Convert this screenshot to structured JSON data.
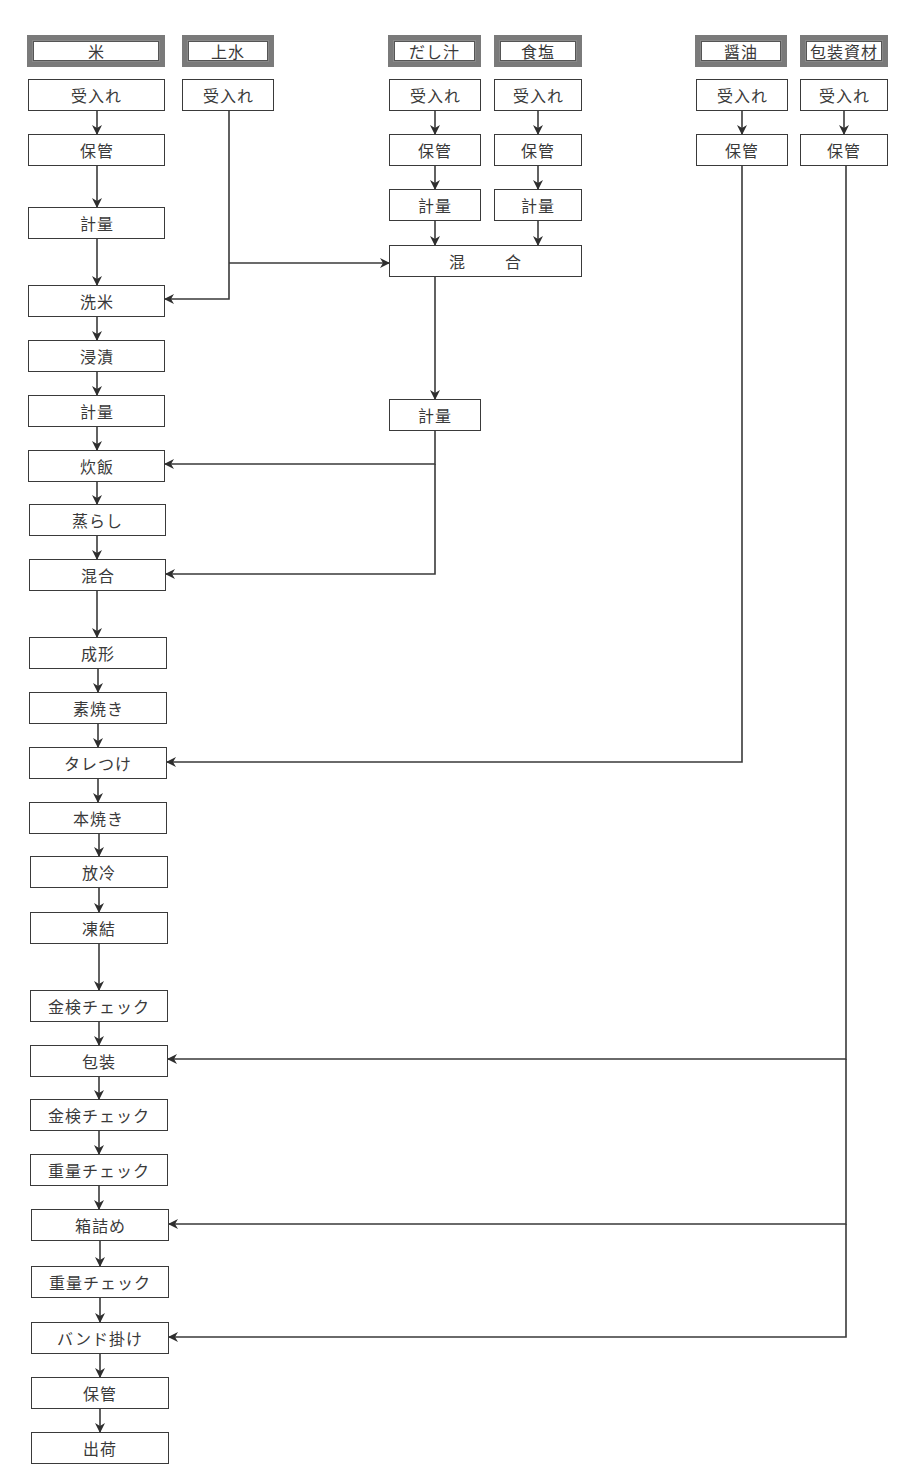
{
  "title": "",
  "colors": {
    "line": "#3a3a3a",
    "source_border": "#7a7a7a",
    "background": "#ffffff"
  },
  "sources": [
    {
      "id": "rice",
      "label": "米",
      "x": 27,
      "y": 35,
      "w": 138,
      "h": 32
    },
    {
      "id": "water",
      "label": "上水",
      "x": 182,
      "y": 35,
      "w": 92,
      "h": 32
    },
    {
      "id": "dashi",
      "label": "だし汁",
      "x": 388,
      "y": 35,
      "w": 93,
      "h": 32
    },
    {
      "id": "salt",
      "label": "食塩",
      "x": 494,
      "y": 35,
      "w": 88,
      "h": 32
    },
    {
      "id": "soy",
      "label": "醤油",
      "x": 695,
      "y": 35,
      "w": 92,
      "h": 32
    },
    {
      "id": "packaging",
      "label": "包装資材",
      "x": 800,
      "y": 35,
      "w": 88,
      "h": 32
    }
  ],
  "steps": [
    {
      "id": "rice-receive",
      "label": "受入れ",
      "x": 28,
      "y": 79,
      "w": 137,
      "h": 32
    },
    {
      "id": "water-receive",
      "label": "受入れ",
      "x": 182,
      "y": 79,
      "w": 92,
      "h": 32
    },
    {
      "id": "dashi-receive",
      "label": "受入れ",
      "x": 389,
      "y": 79,
      "w": 92,
      "h": 32
    },
    {
      "id": "salt-receive",
      "label": "受入れ",
      "x": 494,
      "y": 79,
      "w": 88,
      "h": 32
    },
    {
      "id": "soy-receive",
      "label": "受入れ",
      "x": 696,
      "y": 79,
      "w": 92,
      "h": 32
    },
    {
      "id": "pack-receive",
      "label": "受入れ",
      "x": 800,
      "y": 79,
      "w": 88,
      "h": 32
    },
    {
      "id": "rice-store",
      "label": "保管",
      "x": 28,
      "y": 134,
      "w": 137,
      "h": 32
    },
    {
      "id": "dashi-store",
      "label": "保管",
      "x": 389,
      "y": 134,
      "w": 92,
      "h": 32
    },
    {
      "id": "salt-store",
      "label": "保管",
      "x": 494,
      "y": 134,
      "w": 88,
      "h": 32
    },
    {
      "id": "soy-store",
      "label": "保管",
      "x": 696,
      "y": 134,
      "w": 92,
      "h": 32
    },
    {
      "id": "pack-store",
      "label": "保管",
      "x": 800,
      "y": 134,
      "w": 88,
      "h": 32
    },
    {
      "id": "rice-weigh",
      "label": "計量",
      "x": 28,
      "y": 207,
      "w": 137,
      "h": 32
    },
    {
      "id": "dashi-weigh",
      "label": "計量",
      "x": 389,
      "y": 189,
      "w": 92,
      "h": 32
    },
    {
      "id": "salt-weigh",
      "label": "計量",
      "x": 494,
      "y": 189,
      "w": 88,
      "h": 32
    },
    {
      "id": "seasoning-mix",
      "label_left": "混",
      "label_right": "合",
      "x": 389,
      "y": 245,
      "w": 193,
      "h": 32
    },
    {
      "id": "wash",
      "label": "洗米",
      "x": 28,
      "y": 285,
      "w": 137,
      "h": 32
    },
    {
      "id": "soak",
      "label": "浸漬",
      "x": 28,
      "y": 340,
      "w": 137,
      "h": 32
    },
    {
      "id": "weigh2",
      "label": "計量",
      "x": 28,
      "y": 395,
      "w": 137,
      "h": 32
    },
    {
      "id": "seasoning-weigh",
      "label": "計量",
      "x": 389,
      "y": 399,
      "w": 92,
      "h": 32
    },
    {
      "id": "cook",
      "label": "炊飯",
      "x": 28,
      "y": 450,
      "w": 137,
      "h": 32
    },
    {
      "id": "steam",
      "label": "蒸らし",
      "x": 29,
      "y": 504,
      "w": 137,
      "h": 32
    },
    {
      "id": "mix",
      "label": "混合",
      "x": 29,
      "y": 559,
      "w": 137,
      "h": 32
    },
    {
      "id": "form",
      "label": "成形",
      "x": 29,
      "y": 637,
      "w": 138,
      "h": 32
    },
    {
      "id": "prebake",
      "label": "素焼き",
      "x": 29,
      "y": 692,
      "w": 138,
      "h": 32
    },
    {
      "id": "sauce",
      "label": "タレつけ",
      "x": 29,
      "y": 747,
      "w": 138,
      "h": 32
    },
    {
      "id": "bake",
      "label": "本焼き",
      "x": 29,
      "y": 802,
      "w": 138,
      "h": 32
    },
    {
      "id": "cool",
      "label": "放冷",
      "x": 30,
      "y": 856,
      "w": 138,
      "h": 32
    },
    {
      "id": "freeze",
      "label": "凍結",
      "x": 30,
      "y": 912,
      "w": 138,
      "h": 32
    },
    {
      "id": "metal-check1",
      "label": "金検チェック",
      "x": 30,
      "y": 990,
      "w": 138,
      "h": 32
    },
    {
      "id": "pack",
      "label": "包装",
      "x": 30,
      "y": 1045,
      "w": 138,
      "h": 32
    },
    {
      "id": "metal-check2",
      "label": "金検チェック",
      "x": 30,
      "y": 1099,
      "w": 138,
      "h": 32
    },
    {
      "id": "weight-check1",
      "label": "重量チェック",
      "x": 30,
      "y": 1154,
      "w": 138,
      "h": 32
    },
    {
      "id": "boxing",
      "label": "箱詰め",
      "x": 31,
      "y": 1209,
      "w": 138,
      "h": 32
    },
    {
      "id": "weight-check2",
      "label": "重量チェック",
      "x": 31,
      "y": 1266,
      "w": 138,
      "h": 32
    },
    {
      "id": "banding",
      "label": "バンド掛け",
      "x": 31,
      "y": 1322,
      "w": 138,
      "h": 32
    },
    {
      "id": "final-store",
      "label": "保管",
      "x": 31,
      "y": 1377,
      "w": 138,
      "h": 32
    },
    {
      "id": "ship",
      "label": "出荷",
      "x": 31,
      "y": 1432,
      "w": 138,
      "h": 32
    }
  ],
  "arrows": [
    [
      [
        97,
        111
      ],
      [
        97,
        134
      ]
    ],
    [
      [
        97,
        166
      ],
      [
        97,
        207
      ]
    ],
    [
      [
        97,
        239
      ],
      [
        97,
        285
      ]
    ],
    [
      [
        97,
        317
      ],
      [
        97,
        340
      ]
    ],
    [
      [
        97,
        372
      ],
      [
        97,
        395
      ]
    ],
    [
      [
        97,
        427
      ],
      [
        97,
        450
      ]
    ],
    [
      [
        97,
        482
      ],
      [
        97,
        504
      ]
    ],
    [
      [
        97,
        536
      ],
      [
        97,
        559
      ]
    ],
    [
      [
        97,
        591
      ],
      [
        97,
        637
      ]
    ],
    [
      [
        98,
        669
      ],
      [
        98,
        692
      ]
    ],
    [
      [
        98,
        724
      ],
      [
        98,
        747
      ]
    ],
    [
      [
        98,
        779
      ],
      [
        98,
        802
      ]
    ],
    [
      [
        99,
        834
      ],
      [
        99,
        856
      ]
    ],
    [
      [
        99,
        888
      ],
      [
        99,
        912
      ]
    ],
    [
      [
        99,
        944
      ],
      [
        99,
        990
      ]
    ],
    [
      [
        99,
        1022
      ],
      [
        99,
        1045
      ]
    ],
    [
      [
        99,
        1077
      ],
      [
        99,
        1099
      ]
    ],
    [
      [
        99,
        1131
      ],
      [
        99,
        1154
      ]
    ],
    [
      [
        99,
        1186
      ],
      [
        99,
        1209
      ]
    ],
    [
      [
        100,
        1241
      ],
      [
        100,
        1266
      ]
    ],
    [
      [
        100,
        1298
      ],
      [
        100,
        1322
      ]
    ],
    [
      [
        100,
        1354
      ],
      [
        100,
        1377
      ]
    ],
    [
      [
        100,
        1409
      ],
      [
        100,
        1432
      ]
    ],
    [
      [
        435,
        111
      ],
      [
        435,
        134
      ]
    ],
    [
      [
        435,
        166
      ],
      [
        435,
        189
      ]
    ],
    [
      [
        435,
        221
      ],
      [
        435,
        245
      ]
    ],
    [
      [
        538,
        111
      ],
      [
        538,
        134
      ]
    ],
    [
      [
        538,
        166
      ],
      [
        538,
        189
      ]
    ],
    [
      [
        538,
        221
      ],
      [
        538,
        245
      ]
    ],
    [
      [
        742,
        111
      ],
      [
        742,
        134
      ]
    ],
    [
      [
        844,
        111
      ],
      [
        844,
        134
      ]
    ],
    [
      [
        229,
        263
      ],
      [
        389,
        263
      ]
    ],
    [
      [
        229,
        111
      ],
      [
        229,
        299
      ],
      [
        165,
        299
      ]
    ],
    [
      [
        435,
        277
      ],
      [
        435,
        399
      ]
    ],
    [
      [
        435,
        431
      ],
      [
        435,
        464
      ],
      [
        165,
        464
      ]
    ],
    [
      [
        435,
        464
      ],
      [
        435,
        574
      ],
      [
        166,
        574
      ]
    ],
    [
      [
        742,
        166
      ],
      [
        742,
        762
      ],
      [
        167,
        762
      ]
    ],
    [
      [
        846,
        166
      ],
      [
        846,
        1059
      ],
      [
        168,
        1059
      ]
    ],
    [
      [
        846,
        1059
      ],
      [
        846,
        1224
      ],
      [
        169,
        1224
      ]
    ],
    [
      [
        846,
        1224
      ],
      [
        846,
        1337
      ],
      [
        169,
        1337
      ]
    ]
  ]
}
